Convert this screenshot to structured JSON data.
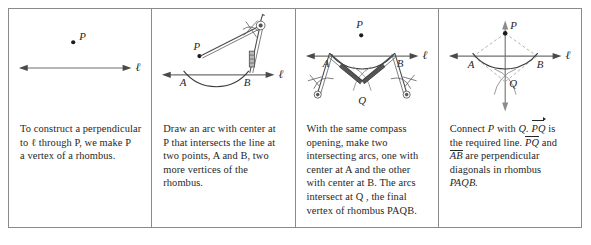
{
  "figure": {
    "panel_count": 4
  },
  "panels": [
    {
      "step": "1",
      "caption_lines": [
        "To construct a perpendicular",
        "to ℓ through  P,  we make P",
        "a vertex of a rhombus."
      ],
      "labels": {
        "point_p": "P",
        "line_l": "ℓ"
      },
      "elements": [
        "point-p",
        "line-l-double-arrow"
      ]
    },
    {
      "step": "2",
      "caption_lines": [
        "Draw an arc with center at",
        "P that intersects the line at",
        "two points,  A and B,  two",
        "more vertices of the",
        "rhombus."
      ],
      "labels": {
        "point_p": "P",
        "point_a": "A",
        "point_b": "B",
        "line_l": "ℓ"
      },
      "elements": [
        "point-p",
        "line-l-double-arrow",
        "arc-through-ab",
        "compass-at-p"
      ]
    },
    {
      "step": "3",
      "caption_lines": [
        "With the same compass",
        "opening, make two",
        "intersecting arcs, one with",
        "center at  A  and the other",
        "with center at B. The arcs",
        "intersect at  Q , the final",
        "vertex of rhombus PAQB."
      ],
      "labels": {
        "point_p": "P",
        "point_a": "A",
        "point_b": "B",
        "point_q": "Q",
        "line_l": "ℓ"
      },
      "elements": [
        "point-p",
        "line-l-double-arrow",
        "arc-through-ab",
        "compass-at-a",
        "compass-at-b",
        "crossing-arcs-at-q"
      ]
    },
    {
      "step": "4",
      "caption_segments": [
        {
          "text": "Connect ",
          "style": "plain"
        },
        {
          "text": "P",
          "style": "italic"
        },
        {
          "text": " with ",
          "style": "plain"
        },
        {
          "text": "Q.",
          "style": "italic"
        },
        {
          "text": " ",
          "style": "plain"
        },
        {
          "text": "PQ",
          "style": "overline-arrow"
        },
        {
          "text": " is",
          "style": "plain"
        },
        {
          "text": "the required line. ",
          "style": "plain"
        },
        {
          "text": "PQ",
          "style": "overline"
        },
        {
          "text": " and",
          "style": "plain"
        },
        {
          "text": "AB",
          "style": "overline"
        },
        {
          "text": " are perpendicular",
          "style": "plain"
        },
        {
          "text": "diagonals in rhombus ",
          "style": "plain"
        },
        {
          "text": "PAQB.",
          "style": "italic"
        }
      ],
      "labels": {
        "point_p": "P",
        "point_a": "A",
        "point_b": "B",
        "point_q": "Q",
        "line_l": "ℓ"
      },
      "elements": [
        "point-p",
        "line-l-double-arrow",
        "arc-through-ab",
        "crossing-arcs-at-q",
        "perpendicular-line-pq",
        "dashed-rhombus-paqb"
      ]
    }
  ],
  "colors": {
    "frame_border": "#8a8a8a",
    "line_gray": "#6f6f6f",
    "arc_dark": "#3a3a3a",
    "dashed_gray": "#a9a9a9",
    "text": "#262626",
    "background": "#ffffff"
  }
}
